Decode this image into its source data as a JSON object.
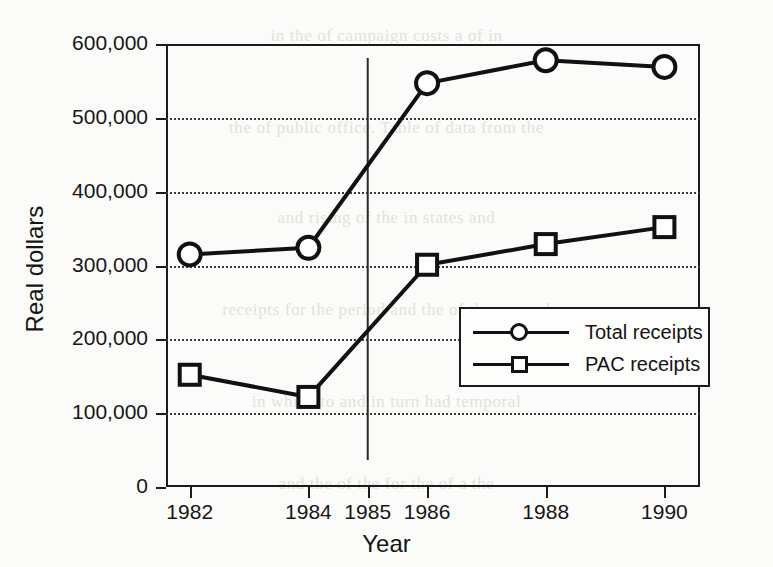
{
  "chart_data": {
    "type": "line",
    "title": "",
    "xlabel": "Year",
    "ylabel": "Real dollars",
    "categories": [
      "1982",
      "1984",
      "1986",
      "1988",
      "1990"
    ],
    "x": [
      1982,
      1984,
      1986,
      1988,
      1990
    ],
    "xlim": [
      1981.6,
      1990.6
    ],
    "ylim": [
      0,
      600000
    ],
    "yticks": [
      0,
      100000,
      200000,
      300000,
      400000,
      500000,
      600000
    ],
    "ytick_labels": [
      "0",
      "100,000",
      "200,000",
      "300,000",
      "400,000",
      "500,000",
      "600,000"
    ],
    "xticks": [
      1982,
      1984,
      1985,
      1986,
      1988,
      1990
    ],
    "xtick_labels": [
      "1982",
      "1984",
      "1985",
      "1986",
      "1988",
      "1990"
    ],
    "grid": "horizontal-dotted",
    "legend_position": "center-right-inside",
    "series": [
      {
        "name": "Total receipts",
        "marker": "circle",
        "values": [
          315000,
          324000,
          547000,
          578000,
          569000
        ]
      },
      {
        "name": "PAC receipts",
        "marker": "square",
        "values": [
          152000,
          122000,
          301000,
          329000,
          352000
        ]
      }
    ],
    "annotations": [
      {
        "type": "vertical-reference-line",
        "x": 1985,
        "label": "1985"
      }
    ]
  },
  "legend": {
    "items": [
      {
        "label": "Total receipts",
        "marker": "circle"
      },
      {
        "label": "PAC receipts",
        "marker": "square"
      }
    ]
  },
  "background_text": {
    "lines": [
      "in the  of campaign  costs  a   of   in",
      "the  of   public  office.   Table   of   data   from   the",
      "and   rising   of   the   in   states   and",
      "receipts  for  the  period  and  the  of  the  general",
      "in  which  to  and  in  turn  had  temporal",
      "and  the  of  the  for  the  of  a  the"
    ]
  }
}
